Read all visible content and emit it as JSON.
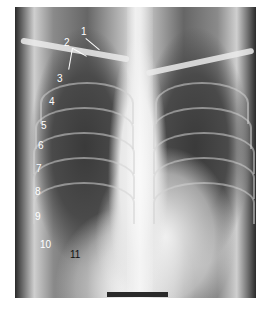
{
  "figure": {
    "labels": [
      {
        "id": "1",
        "text": "1",
        "x": 81,
        "y": 27
      },
      {
        "id": "2",
        "text": "2",
        "x": 64,
        "y": 38
      },
      {
        "id": "3",
        "text": "3",
        "x": 57,
        "y": 74
      },
      {
        "id": "4",
        "text": "4",
        "x": 49,
        "y": 97
      },
      {
        "id": "5",
        "text": "5",
        "x": 41,
        "y": 121
      },
      {
        "id": "6",
        "text": "6",
        "x": 38,
        "y": 141
      },
      {
        "id": "7",
        "text": "7",
        "x": 36,
        "y": 164
      },
      {
        "id": "8",
        "text": "8",
        "x": 35,
        "y": 187
      },
      {
        "id": "9",
        "text": "9",
        "x": 35,
        "y": 212
      },
      {
        "id": "10",
        "text": "10",
        "x": 40,
        "y": 240
      },
      {
        "id": "11",
        "text": "11",
        "x": 70,
        "y": 250
      }
    ],
    "scale_bar": {
      "visible": true
    }
  }
}
